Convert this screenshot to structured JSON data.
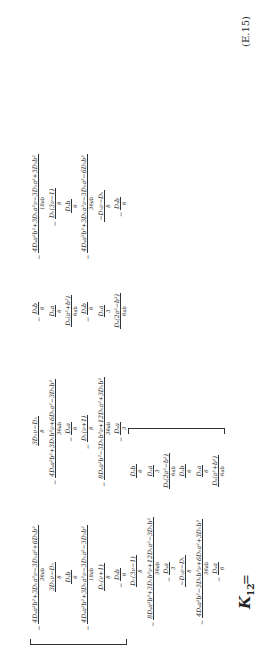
{
  "equation": {
    "lhs": "K",
    "lhs_sub": "12",
    "equals": "=",
    "tag": "(E.15)",
    "columns": [
      [
        {
          "sign": "−",
          "num": "4Dₛa²b²+3Dₕa²ν−3Dₕa²+6Dₕb²",
          "den": "36ab"
        },
        {
          "sign": "",
          "num": "3Dₕν−Dₕ",
          "den": "8"
        },
        {
          "sign": "",
          "num": "Dₛb",
          "den": "6"
        },
        {
          "sign": "−",
          "num": "4Dₛa²b²+3Dₕa²ν−3Dₕa²−3Dₕb²",
          "den": "18ab"
        },
        {
          "sign": "",
          "num": "Dₕ(ν+1)",
          "den": "8"
        },
        {
          "sign": "−",
          "num": "Dₛb",
          "den": "6"
        }
      ],
      [
        {
          "sign": "",
          "num": "3Dₕν−Dₕ",
          "den": "8"
        },
        {
          "sign": "−",
          "num": "4Dₛa²b²+3Dₕb²ν+6Dₕa²−3Dₕb²",
          "den": "36ab"
        },
        {
          "sign": "−",
          "num": "Dₛa",
          "den": "6"
        },
        {
          "sign": "−",
          "num": "Dₕ(ν+1)",
          "den": "8"
        },
        {
          "sign": "−",
          "num": "8Dₛa²b²−3Dₕb²ν+12Dₕa²+3Dₕb²",
          "den": "36ab"
        },
        {
          "sign": "−",
          "num": "Dₛa",
          "den": "3"
        }
      ],
      [
        {
          "sign": "−",
          "num": "Dₛb",
          "den": "6"
        },
        {
          "sign": "",
          "num": "Dₛa",
          "den": "6"
        },
        {
          "sign": "",
          "num": "Dₛ(a²+b²)",
          "den": "6ab"
        },
        {
          "sign": "−",
          "num": "Dₛb",
          "den": "6"
        },
        {
          "sign": "",
          "num": "Dₛa",
          "den": "3"
        },
        {
          "sign": "",
          "num": "Dₛ(2a²−b²)",
          "den": "6ab"
        }
      ],
      [
        {
          "sign": "−",
          "num": "4Dₛa²b²+3Dₕa²ν−3Dₕa²+3Dₕb²",
          "den": "18ab"
        },
        {
          "sign": "−",
          "num": "Dₕ(3ν−1)",
          "den": "8"
        },
        {
          "sign": "",
          "num": "Dₛb",
          "den": "6"
        },
        {
          "sign": "−",
          "num": "4Dₛa²b²+3Dₕa²ν−3Dₕa²−6Dₕb²",
          "den": "36ab"
        },
        {
          "sign": "",
          "num": "−Dₕν−Dₕ",
          "den": "8"
        },
        {
          "sign": "−",
          "num": "Dₛb",
          "den": "6"
        }
      ],
      [
        {
          "sign": "",
          "num": "Dₕ(3ν−1)",
          "den": "8"
        },
        {
          "sign": "−",
          "num": "8Dₛa²b²+3Dₕb²ν+12Dₕa²−3Dₕb²",
          "den": "36ab"
        },
        {
          "sign": "−",
          "num": "Dₛa",
          "den": "3"
        },
        {
          "sign": "",
          "num": "−Dₕν−Dₕ",
          "den": "8"
        },
        {
          "sign": "−",
          "num": "4Dₛa²b²−3Dₕb²ν+6Dₕa²+3Dₕb²",
          "den": "36ab"
        },
        {
          "sign": "−",
          "num": "Dₛa",
          "den": "6"
        }
      ],
      [
        {
          "sign": "",
          "num": "Dₛb",
          "den": "6"
        },
        {
          "sign": "",
          "num": "Dₛa",
          "den": "3"
        },
        {
          "sign": "",
          "num": "Dₛ(2a²−b²)",
          "den": "6ab"
        },
        {
          "sign": "",
          "num": "Dₛb",
          "den": "6"
        },
        {
          "sign": "",
          "num": "Dₛa",
          "den": "6"
        },
        {
          "sign": "",
          "num": "Dₛ(a²+b²)",
          "den": "6ab"
        }
      ]
    ]
  }
}
